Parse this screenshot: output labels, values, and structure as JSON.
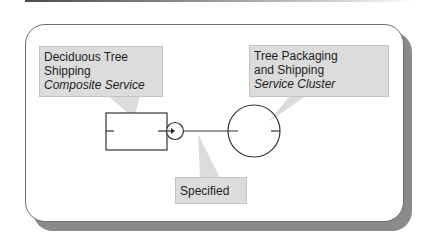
{
  "diagram": {
    "callouts": [
      {
        "id": "composite",
        "lines": [
          "Deciduous Tree",
          "Shipping"
        ],
        "italic": "Composite Service"
      },
      {
        "id": "cluster",
        "lines": [
          "Tree Packaging",
          "and Shipping"
        ],
        "italic": "Service Cluster"
      },
      {
        "id": "specified",
        "lines": [
          "Specified"
        ],
        "italic": ""
      }
    ],
    "nodes": [
      {
        "id": "composite-service",
        "shape": "rectangle"
      },
      {
        "id": "service-cluster",
        "shape": "circle"
      },
      {
        "id": "interface",
        "shape": "small-circle-with-arrow"
      }
    ],
    "edges": [
      {
        "from": "composite-service",
        "to": "service-cluster",
        "label": "Specified"
      }
    ],
    "colors": {
      "callout_fill": "#dcdcdc",
      "callout_border": "#c4c4c4",
      "stroke": "#333333",
      "shadow": "#8a8a8a"
    }
  }
}
